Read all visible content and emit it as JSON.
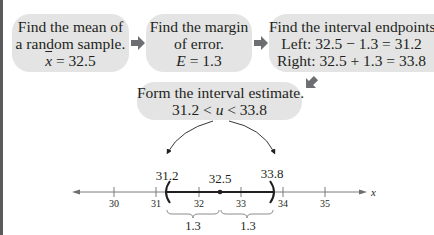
{
  "steps": [
    {
      "id": "mean",
      "lines": [
        "Find the mean of",
        "a random sample."
      ],
      "formula": {
        "symbol": "x",
        "rest": " = 32.5"
      }
    },
    {
      "id": "margin",
      "lines": [
        "Find the margin",
        "of error."
      ],
      "formula": {
        "symbol": "E",
        "rest": " = 1.3"
      }
    },
    {
      "id": "endpoints",
      "lines": [
        "Find the interval endpoints.",
        "Left: 32.5 − 1.3 = 31.2",
        "Right: 32.5 + 1.3 = 33.8"
      ]
    },
    {
      "id": "estimate",
      "lines": [
        "Form the interval estimate."
      ],
      "formula": {
        "pre": "31.2 < ",
        "symbol": "u",
        "post": " < 33.8"
      }
    }
  ],
  "number_line": {
    "ticks": [
      "30",
      "31",
      "32",
      "33",
      "34",
      "35"
    ],
    "axis_label": "x",
    "left_endpoint": "31.2",
    "center": "32.5",
    "right_endpoint": "33.8",
    "brace_left": "1.3",
    "brace_right": "1.3"
  },
  "colors": {
    "box_fill": "#e4e4e4",
    "arrow": "#6d6e71",
    "text": "#231f20"
  }
}
